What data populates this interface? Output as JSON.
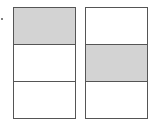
{
  "diagram": {
    "colors": {
      "shaded": "#d3d3d3",
      "unshaded": "#ffffff",
      "stroke": "#555555"
    },
    "figures": [
      {
        "name": "left",
        "parts": 3,
        "shaded_index": 0
      },
      {
        "name": "right",
        "parts": 3,
        "shaded_index": 1
      }
    ]
  }
}
